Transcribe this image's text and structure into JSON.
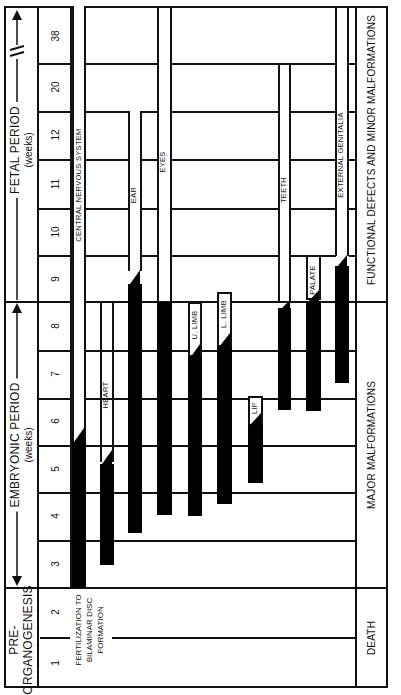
{
  "diagram": {
    "orientation": "rotated 90 degrees counter-clockwise"
  },
  "periods": {
    "pre_organogenesis": {
      "label_line1": "PRE-",
      "label_line2": "ORGANOGENESIS"
    },
    "embryonic": {
      "label": "EMBRYONIC PERIOD",
      "unit": "(weeks)"
    },
    "fetal": {
      "label": "FETAL PERIOD",
      "unit": "(weeks)",
      "break_mark": "//"
    }
  },
  "weeks": [
    "1",
    "2",
    "3",
    "4",
    "5",
    "6",
    "7",
    "8",
    "9",
    "10",
    "11",
    "12",
    "20",
    "38"
  ],
  "pre_organogenesis_note": {
    "line1": "FERTILIZATION TO",
    "line2": "BILAMINAR DISC",
    "line3": "FORMATION"
  },
  "organs": [
    {
      "name": "CENTRAL NERVOUS SYSTEM",
      "sensitive_start_week": 3,
      "highly_sensitive_end_week": 5.5,
      "period_end_week": 38
    },
    {
      "name": "HEART",
      "sensitive_start_week": 3,
      "highly_sensitive_end_week": 6.3,
      "period_end_week": 8
    },
    {
      "name": "EAR",
      "sensitive_start_week": 4,
      "highly_sensitive_end_week": 9.2,
      "period_end_week": 20
    },
    {
      "name": "EYES",
      "sensitive_start_week": 4,
      "highly_sensitive_end_week": 8,
      "period_end_week": 38
    },
    {
      "name": "U. LIMB",
      "sensitive_start_week": 4,
      "highly_sensitive_end_week": 7.3,
      "period_end_week": 8
    },
    {
      "name": "L. LIMB",
      "sensitive_start_week": 4.3,
      "highly_sensitive_end_week": 7.6,
      "period_end_week": 8.2
    },
    {
      "name": "LIP",
      "sensitive_start_week": 5.4,
      "highly_sensitive_end_week": 6,
      "period_end_week": 6.3
    },
    {
      "name": "TEETH",
      "sensitive_start_week": 6.6,
      "highly_sensitive_end_week": 8,
      "period_end_week": 20
    },
    {
      "name": "PALATE",
      "sensitive_start_week": 6.6,
      "highly_sensitive_end_week": 8.6,
      "period_end_week": 9
    },
    {
      "name": "EXTERNAL GENITALIA",
      "sensitive_start_week": 7.2,
      "highly_sensitive_end_week": 9.2,
      "period_end_week": 38
    }
  ],
  "outcomes": {
    "pre_organogenesis": "DEATH",
    "embryonic": "MAJOR MALFORMATIONS",
    "fetal": "FUNCTIONAL DEFECTS AND MINOR MALFORMATIONS"
  },
  "colors": {
    "ink": "#111111",
    "bar": "#000000",
    "background": "#ffffff"
  }
}
